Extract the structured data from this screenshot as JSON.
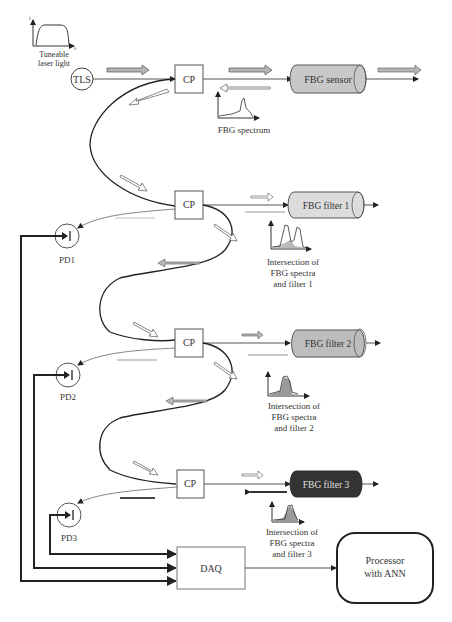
{
  "diagram": {
    "laser_inset": {
      "caption_line1": "Tuneable",
      "caption_line2": "laser light",
      "y_axis": "I",
      "x_axis": "λ"
    },
    "source": {
      "label": "TLS"
    },
    "couplers": [
      {
        "label": "CP"
      },
      {
        "label": "CP"
      },
      {
        "label": "CP"
      },
      {
        "label": "CP"
      }
    ],
    "sensor": {
      "label": "FBG sensor",
      "fill": "#c8c8c8"
    },
    "filters": [
      {
        "label": "FBG filter 1",
        "fill": "#dcdcdc"
      },
      {
        "label": "FBG filter 2",
        "fill": "#bdbdbd"
      },
      {
        "label": "FBG filter 3",
        "fill": "#333333"
      }
    ],
    "spectrum_captions": {
      "sensor": "FBG spectrum",
      "filter1": [
        "Intersection of",
        "FBG spectra",
        "and filter 1"
      ],
      "filter2": [
        "Intersection of",
        "FBG spectra",
        "and filter 2"
      ],
      "filter3": [
        "Intersection of",
        "FBG spectra",
        "and filter 3"
      ]
    },
    "photodiodes": [
      {
        "label": "PD1"
      },
      {
        "label": "PD2"
      },
      {
        "label": "PD3"
      }
    ],
    "daq": {
      "label": "DAQ"
    },
    "processor": {
      "line1": "Processor",
      "line2": "with ANN"
    }
  }
}
